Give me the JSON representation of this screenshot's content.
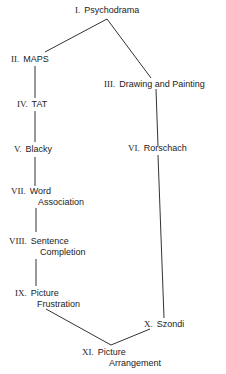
{
  "diagram": {
    "nodes": [
      {
        "id": "I",
        "numeral": "I.",
        "label": "Psychodrama",
        "label2": ""
      },
      {
        "id": "II",
        "numeral": "II.",
        "label": "MAPS",
        "label2": ""
      },
      {
        "id": "III",
        "numeral": "III.",
        "label": "Drawing and Painting",
        "label2": ""
      },
      {
        "id": "IV",
        "numeral": "IV.",
        "label": "TAT",
        "label2": ""
      },
      {
        "id": "V",
        "numeral": "V.",
        "label": "Blacky",
        "label2": ""
      },
      {
        "id": "VI",
        "numeral": "VI.",
        "label": "Rorschach",
        "label2": ""
      },
      {
        "id": "VII",
        "numeral": "VII.",
        "label": "Word",
        "label2": "Association"
      },
      {
        "id": "VIII",
        "numeral": "VIII.",
        "label": "Sentence",
        "label2": "Completion"
      },
      {
        "id": "IX",
        "numeral": "IX.",
        "label": "Picture",
        "label2": "Frustration"
      },
      {
        "id": "X",
        "numeral": "X.",
        "label": "Szondi",
        "label2": ""
      },
      {
        "id": "XI",
        "numeral": "XI.",
        "label": "Picture",
        "label2": "Arrangement"
      }
    ],
    "edges": [
      [
        "I",
        "II"
      ],
      [
        "I",
        "III"
      ],
      [
        "II",
        "IV"
      ],
      [
        "IV",
        "V"
      ],
      [
        "V",
        "VII"
      ],
      [
        "VII",
        "VIII"
      ],
      [
        "VIII",
        "IX"
      ],
      [
        "IX",
        "XI"
      ],
      [
        "III",
        "VI"
      ],
      [
        "VI",
        "X"
      ],
      [
        "X",
        "XI"
      ]
    ],
    "line_color": "#333333"
  }
}
